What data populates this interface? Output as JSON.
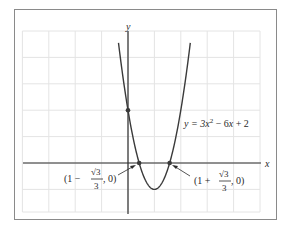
{
  "chart_data": {
    "type": "line",
    "title": "",
    "xlabel": "x",
    "ylabel": "y",
    "function": "y = 3x^2 - 6x + 2",
    "equation_label": {
      "prefix": "y = 3",
      "x1": "x",
      "exp": "2",
      "mid": " − 6",
      "x2": "x",
      "suffix": " + 2"
    },
    "grid": true,
    "xlim": [
      -4,
      5
    ],
    "ylim": [
      -2,
      5
    ],
    "x": [
      -0.36,
      -0.2,
      0,
      0.2,
      0.4228,
      0.6,
      0.8,
      1,
      1.2,
      1.4,
      1.5774,
      1.8,
      2,
      2.2,
      2.36
    ],
    "y": [
      4.55,
      3.32,
      2,
      0.92,
      0,
      -0.52,
      -0.88,
      -1,
      -0.88,
      -0.52,
      0,
      0.92,
      2,
      3.32,
      4.55
    ],
    "marked_points": [
      {
        "name": "y-intercept",
        "x": 0,
        "y": 2
      },
      {
        "name": "left-root",
        "x": 0.4226,
        "y": 0
      },
      {
        "name": "right-root",
        "x": 1.5774,
        "y": 0
      }
    ],
    "annotations": {
      "left_root": {
        "open": "(1 − ",
        "num": "√3",
        "den": "3",
        "close": ", 0)"
      },
      "right_root": {
        "open": "(1 + ",
        "num": "√3",
        "den": "3",
        "close": ", 0)"
      }
    }
  },
  "colors": {
    "curve": "#3a3a3a",
    "axis": "#2e2e2e",
    "grid": "#e4e4e4",
    "frame": "#8a8a8a"
  }
}
